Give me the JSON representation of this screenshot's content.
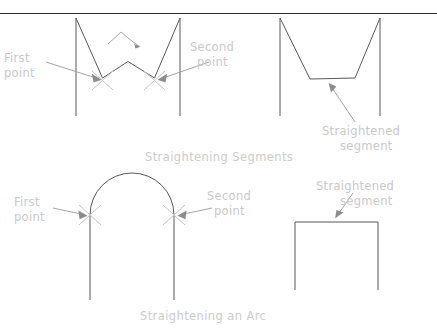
{
  "figure": {
    "title_implied": "Straightening Segments and Arcs",
    "background_color": "#ffffff",
    "geometry_color": "#595959",
    "label_color": "#c9c9c9",
    "arrow_color": "#8c8c8c",
    "xmark_color": "#c4c4c4",
    "rule_color": "#2b2b2b"
  },
  "panels": {
    "top": {
      "caption": "Straightening Segments",
      "before": {
        "labels": {
          "first_point_line1": "First",
          "first_point_line2": "point",
          "second_point_line1": "Second",
          "second_point_line2": "point"
        }
      },
      "after": {
        "labels": {
          "straightened_line1": "Straightened",
          "straightened_line2": "segment"
        }
      }
    },
    "bottom": {
      "caption": "Straightening an Arc",
      "before": {
        "labels": {
          "first_point_line1": "First",
          "first_point_line2": "point",
          "second_point_line1": "Second",
          "second_point_line2": "point"
        }
      },
      "after": {
        "labels": {
          "straightened_line1": "Straightened",
          "straightened_line2": "segment"
        }
      }
    }
  }
}
